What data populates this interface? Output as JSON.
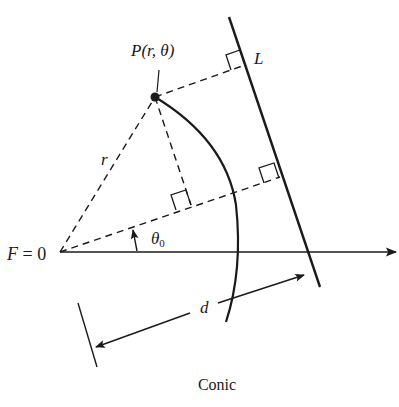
{
  "figure": {
    "caption": "Conic",
    "labels": {
      "point": "P(r, θ)",
      "directrix": "L",
      "radius": "r",
      "focus": "F = 0",
      "angle": "θ",
      "angle_sub": "0",
      "distance": "d"
    },
    "colors": {
      "ink": "#1a1a1a",
      "background": "#ffffff"
    }
  }
}
